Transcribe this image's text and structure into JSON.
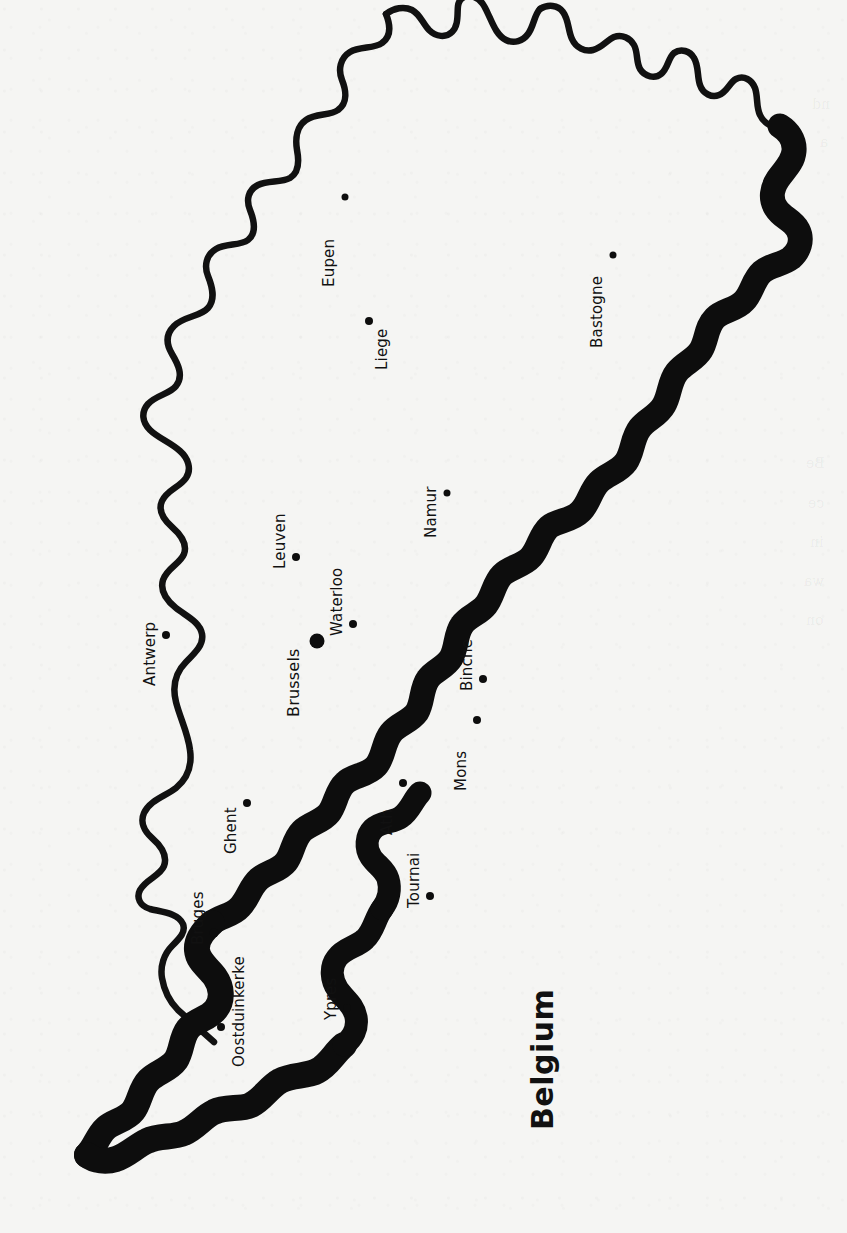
{
  "document": {
    "type": "printed-map-page",
    "title": "Belgium",
    "orientation_note": "map rotated 90 degrees clockwise on the page",
    "background_color": "#f5f5f3",
    "ink_color": "#0d0d0d"
  },
  "map": {
    "title": "Belgium",
    "title_position": {
      "x": 560,
      "y": 1095
    },
    "border_styles": {
      "thin_border_label": "national border (north and east)",
      "thick_border_label": "coastline and southern border",
      "thin_stroke_px": 6,
      "thick_stroke_px": 26
    },
    "cities": [
      {
        "name": "Eupen",
        "x": 345,
        "y": 197,
        "dot_size": 7,
        "label_x": 338,
        "label_y": 269,
        "capital": false
      },
      {
        "name": "Bastogne",
        "x": 613,
        "y": 255,
        "dot_size": 7,
        "label_x": 606,
        "label_y": 330,
        "capital": false
      },
      {
        "name": "Liege",
        "x": 369,
        "y": 321,
        "dot_size": 8,
        "label_x": 391,
        "label_y": 352,
        "capital": false
      },
      {
        "name": "Namur",
        "x": 447,
        "y": 493,
        "dot_size": 7,
        "label_x": 440,
        "label_y": 520,
        "capital": false
      },
      {
        "name": "Leuven",
        "x": 296,
        "y": 557,
        "dot_size": 8,
        "label_x": 289,
        "label_y": 551,
        "capital": false
      },
      {
        "name": "Waterloo",
        "x": 353,
        "y": 624,
        "dot_size": 8,
        "label_x": 346,
        "label_y": 618,
        "capital": false
      },
      {
        "name": "Brussels",
        "x": 317,
        "y": 641,
        "dot_size": 15,
        "label_x": 303,
        "label_y": 698,
        "capital": true
      },
      {
        "name": "Antwerp",
        "x": 166,
        "y": 635,
        "dot_size": 8,
        "label_x": 159,
        "label_y": 668,
        "capital": false
      },
      {
        "name": "Binche",
        "x": 483,
        "y": 679,
        "dot_size": 8,
        "label_x": 476,
        "label_y": 673,
        "capital": false
      },
      {
        "name": "Mons",
        "x": 477,
        "y": 720,
        "dot_size": 8,
        "label_x": 470,
        "label_y": 773,
        "capital": false
      },
      {
        "name": "Ath",
        "x": 403,
        "y": 783,
        "dot_size": 8,
        "label_x": 396,
        "label_y": 817,
        "capital": false
      },
      {
        "name": "Ghent",
        "x": 247,
        "y": 803,
        "dot_size": 8,
        "label_x": 240,
        "label_y": 836,
        "capital": false
      },
      {
        "name": "Tournai",
        "x": 430,
        "y": 896,
        "dot_size": 8,
        "label_x": 423,
        "label_y": 890,
        "capital": false
      },
      {
        "name": "Bruges",
        "x": 214,
        "y": 933,
        "dot_size": 9,
        "label_x": 207,
        "label_y": 927,
        "capital": false
      },
      {
        "name": "Ypres",
        "x": 347,
        "y": 1008,
        "dot_size": 8,
        "label_x": 340,
        "label_y": 1002,
        "capital": false
      },
      {
        "name": "Oostduinkerke",
        "x": 221,
        "y": 1027,
        "dot_size": 8,
        "label_x": 248,
        "label_y": 1049,
        "capital": false
      }
    ]
  },
  "reverse_page_bleed": [
    {
      "text": "nd",
      "x": 812,
      "y": 96
    },
    {
      "text": "a",
      "x": 820,
      "y": 134
    },
    {
      "text": "Be",
      "x": 806,
      "y": 455
    },
    {
      "text": "ce",
      "x": 808,
      "y": 495
    },
    {
      "text": "in",
      "x": 810,
      "y": 534
    },
    {
      "text": "wa",
      "x": 804,
      "y": 573
    },
    {
      "text": "on",
      "x": 806,
      "y": 612
    }
  ]
}
